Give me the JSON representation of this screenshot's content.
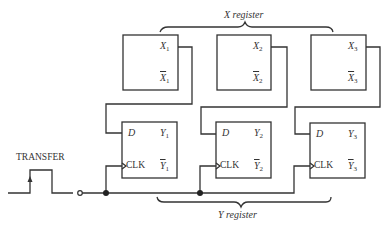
{
  "diagram": {
    "x_register_label": "X register",
    "y_register_label": "Y register",
    "transfer_label": "TRANSFER",
    "x_flipflops": [
      {
        "q": "X",
        "q_bar": "X",
        "index": "1"
      },
      {
        "q": "X",
        "q_bar": "X",
        "index": "2"
      },
      {
        "q": "X",
        "q_bar": "X",
        "index": "3"
      }
    ],
    "y_flipflops": [
      {
        "d": "D",
        "clk": "CLK",
        "q": "Y",
        "q_bar": "Y",
        "index": "1"
      },
      {
        "d": "D",
        "clk": "CLK",
        "q": "Y",
        "q_bar": "Y",
        "index": "2"
      },
      {
        "d": "D",
        "clk": "CLK",
        "q": "Y",
        "q_bar": "Y",
        "index": "3"
      }
    ],
    "colors": {
      "line": "#333333",
      "background": "#ffffff"
    }
  }
}
